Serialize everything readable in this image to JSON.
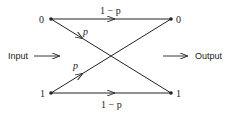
{
  "diagram": {
    "input_label": "Input",
    "output_label": "Output",
    "input_nodes": [
      {
        "label": "0"
      },
      {
        "label": "1"
      }
    ],
    "output_nodes": [
      {
        "label": "0"
      },
      {
        "label": "1"
      }
    ],
    "edges": [
      {
        "from": "0",
        "to": "0",
        "label": "1 − p"
      },
      {
        "from": "0",
        "to": "1",
        "label": "p"
      },
      {
        "from": "1",
        "to": "0",
        "label": "p"
      },
      {
        "from": "1",
        "to": "1",
        "label": "1 − p"
      }
    ],
    "colors": {
      "line": "#222222",
      "background": "#ffffff"
    }
  }
}
